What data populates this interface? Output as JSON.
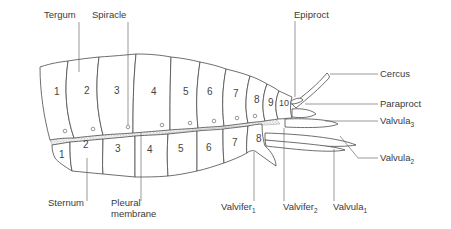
{
  "diagram": {
    "type": "anatomical-labelled-drawing",
    "labels": {
      "tergum": "Tergum",
      "spiracle": "Spiracle",
      "epiproct": "Epiproct",
      "cercus": "Cercus",
      "paraproct": "Paraproct",
      "valvula3": "Valvula",
      "valvula3_sub": "3",
      "valvula2": "Valvula",
      "valvula2_sub": "2",
      "sternum": "Sternum",
      "pleural_line1": "Pleural",
      "pleural_line2": "membrane",
      "valvifer1": "Valvifer",
      "valvifer1_sub": "1",
      "valvifer2": "Valvifer",
      "valvifer2_sub": "2",
      "valvula1": "Valvula",
      "valvula1_sub": "1"
    },
    "tergite_numbers": [
      "1",
      "2",
      "3",
      "4",
      "5",
      "6",
      "7",
      "8",
      "9",
      "10"
    ],
    "sternite_numbers": [
      "1",
      "2",
      "3",
      "4",
      "5",
      "6",
      "7",
      "8"
    ],
    "colors": {
      "outline": "#4a4a4a",
      "text": "#3a3a3a",
      "membrane_stipple": "#9a9a9a",
      "background": "#ffffff"
    }
  }
}
